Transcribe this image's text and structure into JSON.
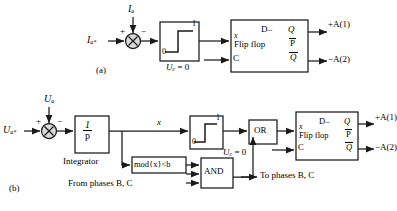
{
  "figure": {
    "title_a": "(a)",
    "title_b": "(b)",
    "colors": {
      "line": "#1a1a1a",
      "box_fill": "#ffffff",
      "box_edge": "#1a1a1a"
    }
  },
  "diagram_a": {
    "caption": "(a)",
    "input_ref": "I",
    "input_ref_sub": "a*",
    "feedback": "I",
    "feedback_sub": "a",
    "sum_plus": "+",
    "sum_minus": "−",
    "relay_low": "0",
    "relay_high": "1",
    "clock_label": "U",
    "clock_sub": "c",
    "clock_value": "= 0",
    "ff_x": "x",
    "ff_d": "D–",
    "ff_q": "Q",
    "ff_name": "Flip flop",
    "ff_p": "P",
    "ff_qbar": "Q",
    "ff_c": "C",
    "out_pos": "+A(1)",
    "out_neg": "−A(2)"
  },
  "diagram_b": {
    "caption": "(b)",
    "input_ref": "U",
    "input_ref_sub": "a*",
    "feedback": "U",
    "feedback_sub": "a",
    "sum_plus": "+",
    "sum_minus": "−",
    "integrator_num": "1",
    "integrator_den": "p",
    "integrator_label": "Integrator",
    "signal_x": "x",
    "relay_low": "0",
    "relay_high": "1",
    "mod_block": "mod{x}<b",
    "from_phases": "From phases B, C",
    "and_gate": "AND",
    "or_gate": "OR",
    "to_phases": "To phases B, C",
    "clock_label": "U",
    "clock_sub": "c",
    "clock_value": "= 0",
    "ff_x": "x",
    "ff_d": "D–",
    "ff_q": "Q",
    "ff_name": "Flip flop",
    "ff_p": "P",
    "ff_qbar": "Q",
    "ff_c": "C",
    "out_pos": "+A(1)",
    "out_neg": "−A(2)"
  }
}
